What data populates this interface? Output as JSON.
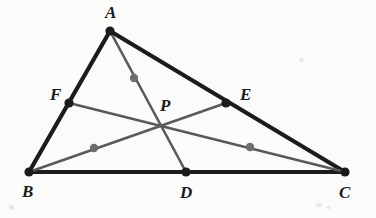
{
  "figure": {
    "background_color": "#fbfbfa",
    "width": 376,
    "height": 218,
    "stroke_color_side": "#1c1c1c",
    "stroke_color_cevian": "#5a5a5a",
    "vertex_dot_color": "#1c1c1c",
    "midpoint_dot_color": "#6e6e6e",
    "label_color": "#1a1a1a",
    "side_stroke_width": 4.2,
    "cevian_stroke_width": 2.6
  },
  "points": [
    {
      "name": "A",
      "label": "A",
      "x": 110,
      "y": 31,
      "label_x": 105,
      "label_y": 4,
      "dot_r": 4.6,
      "kind": "vertex"
    },
    {
      "name": "B",
      "label": "B",
      "x": 29,
      "y": 172,
      "label_x": 22,
      "label_y": 183,
      "dot_r": 4.6,
      "kind": "vertex"
    },
    {
      "name": "C",
      "label": "C",
      "x": 345,
      "y": 172,
      "label_x": 339,
      "label_y": 184,
      "dot_r": 4.6,
      "kind": "vertex"
    },
    {
      "name": "D",
      "label": "D",
      "x": 186,
      "y": 172,
      "label_x": 180,
      "label_y": 184,
      "dot_r": 4.6,
      "kind": "side-point"
    },
    {
      "name": "E",
      "label": "E",
      "x": 226,
      "y": 103,
      "label_x": 240,
      "label_y": 86,
      "dot_r": 4.6,
      "kind": "side-point"
    },
    {
      "name": "F",
      "label": "F",
      "x": 69,
      "y": 103,
      "label_x": 50,
      "label_y": 86,
      "dot_r": 4.6,
      "kind": "side-point"
    },
    {
      "name": "P",
      "label": "P",
      "x": 163,
      "y": 125,
      "label_x": 160,
      "label_y": 97,
      "dot_r": 0,
      "kind": "intersection"
    }
  ],
  "segments": [
    {
      "name": "side-AB",
      "from": "A",
      "to": "B",
      "x1": 110,
      "y1": 31,
      "x2": 29,
      "y2": 172,
      "style": "side"
    },
    {
      "name": "side-AC",
      "from": "A",
      "to": "C",
      "x1": 110,
      "y1": 31,
      "x2": 345,
      "y2": 172,
      "style": "side"
    },
    {
      "name": "side-BC",
      "from": "B",
      "to": "C",
      "x1": 29,
      "y1": 172,
      "x2": 345,
      "y2": 172,
      "style": "side"
    },
    {
      "name": "cevian-AD",
      "from": "A",
      "to": "D",
      "x1": 110,
      "y1": 31,
      "x2": 186,
      "y2": 172,
      "style": "cevian"
    },
    {
      "name": "cevian-BE",
      "from": "B",
      "to": "E",
      "x1": 29,
      "y1": 172,
      "x2": 226,
      "y2": 103,
      "style": "cevian"
    },
    {
      "name": "cevian-CF",
      "from": "C",
      "to": "F",
      "x1": 345,
      "y1": 172,
      "x2": 69,
      "y2": 103,
      "style": "cevian"
    }
  ],
  "midpoint_markers": [
    {
      "name": "marker-on-AD",
      "on_segment": "cevian-AD",
      "x": 134,
      "y": 78,
      "r": 4.2
    },
    {
      "name": "marker-on-BE",
      "on_segment": "cevian-BE",
      "x": 94,
      "y": 148,
      "r": 4.2
    },
    {
      "name": "marker-on-CF",
      "on_segment": "cevian-CF",
      "x": 250,
      "y": 147,
      "r": 4.2
    }
  ],
  "scan_artifacts": [
    {
      "name": "artifact-bottom-right-a",
      "x": 316,
      "y": 203,
      "w": 6,
      "h": 4
    },
    {
      "name": "artifact-bottom-right-b",
      "x": 326,
      "y": 206,
      "w": 5,
      "h": 3
    },
    {
      "name": "artifact-bottom-left",
      "x": 9,
      "y": 205,
      "w": 5,
      "h": 5
    },
    {
      "name": "artifact-top-right",
      "x": 299,
      "y": 58,
      "w": 5,
      "h": 4
    }
  ]
}
